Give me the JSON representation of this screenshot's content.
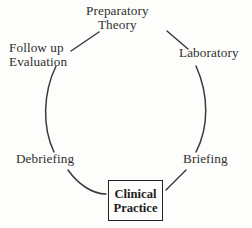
{
  "diagram": {
    "type": "cycle",
    "background_color": "#fdfdfb",
    "stroke_color": "#3a3a3a",
    "text_color": "#2f2f2f",
    "box_border_color": "#222222",
    "nodes": [
      {
        "id": "preparatory-theory",
        "position": "top",
        "lines": [
          "Preparatory",
          "Theory"
        ],
        "boxed": false
      },
      {
        "id": "laboratory",
        "position": "upper-right",
        "lines": [
          "Laboratory"
        ],
        "boxed": false
      },
      {
        "id": "briefing",
        "position": "lower-right",
        "lines": [
          "Briefing"
        ],
        "boxed": false
      },
      {
        "id": "clinical-practice",
        "position": "bottom",
        "lines": [
          "Clinical",
          "Practice"
        ],
        "boxed": true
      },
      {
        "id": "debriefing",
        "position": "lower-left",
        "lines": [
          "Debriefing"
        ],
        "boxed": false
      },
      {
        "id": "follow-up-evaluation",
        "position": "upper-left",
        "lines": [
          "Follow up",
          "Evaluation"
        ],
        "boxed": false
      }
    ],
    "connectors": [
      {
        "from": "follow-up-evaluation",
        "to": "preparatory-theory"
      },
      {
        "from": "preparatory-theory",
        "to": "laboratory"
      },
      {
        "from": "laboratory",
        "to": "briefing"
      },
      {
        "from": "briefing",
        "to": "clinical-practice"
      },
      {
        "from": "clinical-practice",
        "to": "debriefing"
      },
      {
        "from": "debriefing",
        "to": "follow-up-evaluation"
      }
    ]
  }
}
